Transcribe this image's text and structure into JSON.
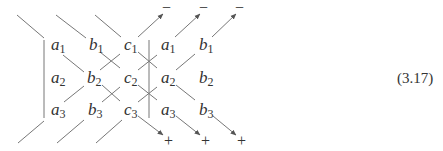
{
  "diagram": {
    "type": "sarrus-rule-3x3-determinant",
    "equation_number": "(3.17)",
    "grid": {
      "columns": [
        "a",
        "b",
        "c",
        "a",
        "b"
      ],
      "rows": [
        [
          "a",
          "b",
          "c",
          "a",
          "b"
        ],
        [
          "a",
          "b",
          "c",
          "a",
          "b"
        ],
        [
          "a",
          "b",
          "c",
          "a",
          "b"
        ]
      ],
      "subscripts": [
        "1",
        "2",
        "3"
      ]
    },
    "labels": {
      "r1": [
        {
          "v": "a",
          "s": "1"
        },
        {
          "v": "b",
          "s": "1"
        },
        {
          "v": "c",
          "s": "1"
        },
        {
          "v": "a",
          "s": "1"
        },
        {
          "v": "b",
          "s": "1"
        }
      ],
      "r2": [
        {
          "v": "a",
          "s": "2"
        },
        {
          "v": "b",
          "s": "2"
        },
        {
          "v": "c",
          "s": "2"
        },
        {
          "v": "a",
          "s": "2"
        },
        {
          "v": "b",
          "s": "2"
        }
      ],
      "r3": [
        {
          "v": "a",
          "s": "3"
        },
        {
          "v": "b",
          "s": "3"
        },
        {
          "v": "c",
          "s": "3"
        },
        {
          "v": "a",
          "s": "3"
        },
        {
          "v": "b",
          "s": "3"
        }
      ]
    },
    "top_signs": [
      "−",
      "−",
      "−"
    ],
    "bottom_signs": [
      "+",
      "+",
      "+"
    ]
  }
}
